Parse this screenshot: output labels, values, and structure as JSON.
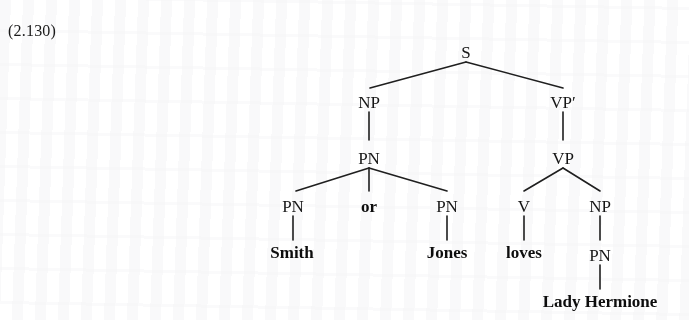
{
  "example": {
    "number": "(2.130)"
  },
  "tree": {
    "nodes": {
      "s": "S",
      "np_subject": "NP",
      "pn_coord": "PN",
      "pn_left": "PN",
      "conj": "or",
      "pn_right": "PN",
      "vp_bar": "VP′",
      "vp": "VP",
      "v": "V",
      "np_object": "NP",
      "pn_object": "PN"
    },
    "leaves": {
      "smith": "Smith",
      "jones": "Jones",
      "loves": "loves",
      "lady_hermione": "Lady Hermione"
    }
  },
  "style": {
    "ink": "#1f1f1f",
    "page": "#ffffff"
  }
}
